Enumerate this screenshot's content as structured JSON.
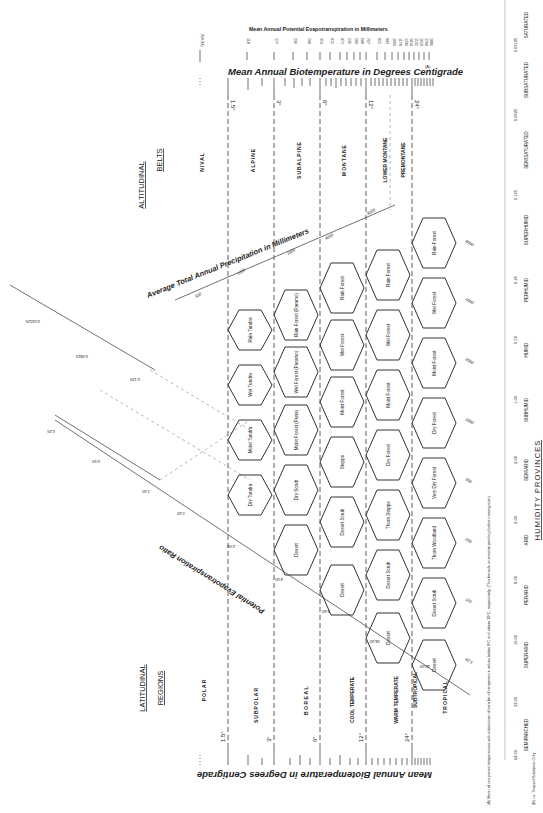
{
  "altitudinal_belts": {
    "heading_line1": "ALTITUDINAL",
    "heading_line2": "BELTS",
    "belts": [
      "NIVAL",
      "ALPINE",
      "SUBALPINE",
      "MONTANE",
      "LOWER MONTANE",
      "PREMONTANE"
    ]
  },
  "latitudinal_regions": {
    "heading_line1": "LATITUDINAL",
    "heading_line2": "REGIONS",
    "regions": [
      "POLAR",
      "SUBPOLAR",
      "BOREAL",
      "COOL TEMPERATE",
      "WARM TEMPERATE",
      "SUBTROPICAL",
      "TROPICAL"
    ]
  },
  "axes": {
    "biotemp_title": "Mean Annual Biotemperature in Degrees Centigrade",
    "biotemp_footnote_mark": "(A)",
    "pet_title": "Mean Annual Potential Evapotranspiration in Millimeters",
    "pet_factor": "(58.93)",
    "pet_values": [
      "118",
      "177",
      "236",
      "294",
      "353",
      "412",
      "471",
      "530",
      "589",
      "648",
      "707",
      "825",
      "943",
      "1060",
      "1178",
      "1296",
      "1414",
      "1532",
      "1650",
      "1768",
      "1886"
    ],
    "temp_marks": [
      "1.5°",
      "3°",
      "6°",
      "12°",
      "24°"
    ],
    "precip_title": "Average Total Annual Precipitation in Millimeters",
    "precip_values": [
      "62.5",
      "125",
      "250",
      "500",
      "1000",
      "2000",
      "4000",
      "8000"
    ],
    "pet_ratio_title": "Potential Evapotranspiration Ratio",
    "pet_ratio_values": [
      "0.125",
      "0.25",
      "0.50",
      "1.00",
      "2.00",
      "4.00",
      "8.00",
      "16.00",
      "32.00"
    ],
    "left_ratio_values": [
      "0.03125",
      "0.0625",
      "0.125",
      "0.25",
      "0.50",
      "1.00",
      "2.00"
    ],
    "humidity_values": [
      "64.00",
      "32.00",
      "16.00",
      "8.00",
      "4.00",
      "2.00",
      "1.00",
      "0.50",
      "0.25",
      "0.125",
      "0.0625",
      "0.03125"
    ]
  },
  "humidity_provinces": {
    "heading": "HUMIDITY PROVINCES",
    "provinces": [
      "SEMIPARCHED",
      "SUPERARID",
      "PERARID",
      "ARID",
      "SEMIARID",
      "SUBHUMID",
      "HUMID",
      "PERHUMID",
      "SUPERHUMID",
      "SEMISATURATED",
      "SUBSATURATED",
      "SATURATED"
    ]
  },
  "life_zones": {
    "polar": [
      "Dry Tundra",
      "Moist Tundra",
      "Wet Tundra",
      "Rain Tundra"
    ],
    "boreal": [
      "Desert",
      "Dry Scrub",
      "Moist Forest (Puna)",
      "Wet Forest (Paramo)",
      "Rain Forest (Paramo)"
    ],
    "cool_temperate": [
      "Desert",
      "Desert Scrub",
      "Steppe",
      "Moist Forest",
      "Wet Forest",
      "Rain Forest"
    ],
    "warm_temperate": [
      "Desert",
      "Desert Scrub",
      "Thorn Steppe",
      "Dry Forest",
      "Moist Forest",
      "Wet Forest",
      "Rain Forest"
    ],
    "tropical": [
      "Desert",
      "Desert Scrub",
      "Thorn Woodland",
      "Very Dry Forest",
      "Dry Forest",
      "Moist Forest",
      "Wet Forest",
      "Rain Forest"
    ]
  },
  "footnotes": {
    "a": "(A) Mean of unit-period temperatures with substitution of zero for all temperature values below 0°C and above 30°C, respectively. (This formula is tentative pending further investigation)",
    "b": "(B) i.e. Tropical Subalpine Only"
  }
}
